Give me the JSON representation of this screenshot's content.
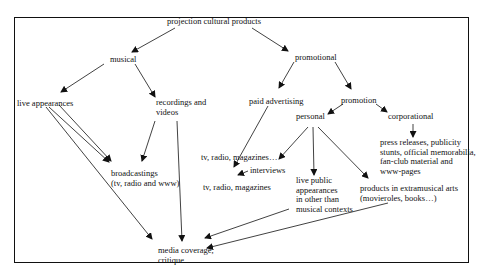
{
  "diagram": {
    "root": "projection cultural products",
    "nodes": {
      "musical": "musical",
      "promotional": "promotional",
      "live_appearances": "live appearances",
      "recordings": [
        "recordings and",
        "videos"
      ],
      "broadcastings": [
        "broadcastings",
        "(tv, radio and www)"
      ],
      "media": [
        "media coverage,",
        "critique"
      ],
      "paid_advertising": "paid advertising",
      "promotion": "promotion",
      "personal": "personal",
      "corporational": "corporational",
      "tv_radio_mag_ellipsis": "tv, radio, magazines…",
      "interviews": "interviews",
      "tv_radio_mag": "tv, radio, magazines",
      "live_public": [
        "live public",
        "appearances",
        "in other than",
        "musical contexts"
      ],
      "products_extra": [
        "products in extramusical arts",
        "(movieroles, books…)"
      ],
      "press": [
        "press releases, publicity",
        "stunts, official memorabilia,",
        "fan-club material and",
        "www-pages"
      ]
    },
    "edges": [
      [
        "projection cultural products",
        "musical"
      ],
      [
        "projection cultural products",
        "promotional"
      ],
      [
        "musical",
        "live appearances"
      ],
      [
        "musical",
        "recordings and videos"
      ],
      [
        "live appearances",
        "broadcastings"
      ],
      [
        "live appearances",
        "media coverage"
      ],
      [
        "recordings and videos",
        "broadcastings"
      ],
      [
        "recordings and videos",
        "media coverage"
      ],
      [
        "promotional",
        "paid advertising"
      ],
      [
        "promotional",
        "promotion"
      ],
      [
        "paid advertising",
        "tv, radio, magazines…"
      ],
      [
        "promotion",
        "personal"
      ],
      [
        "promotion",
        "corporational"
      ],
      [
        "personal",
        "tv, radio, magazines…"
      ],
      [
        "personal",
        "live public appearances"
      ],
      [
        "personal",
        "products in extramusical arts"
      ],
      [
        "interviews",
        "tv, radio, magazines"
      ],
      [
        "corporational",
        "press releases"
      ],
      [
        "live public appearances",
        "media coverage"
      ],
      [
        "products in extramusical arts",
        "media coverage"
      ]
    ]
  }
}
